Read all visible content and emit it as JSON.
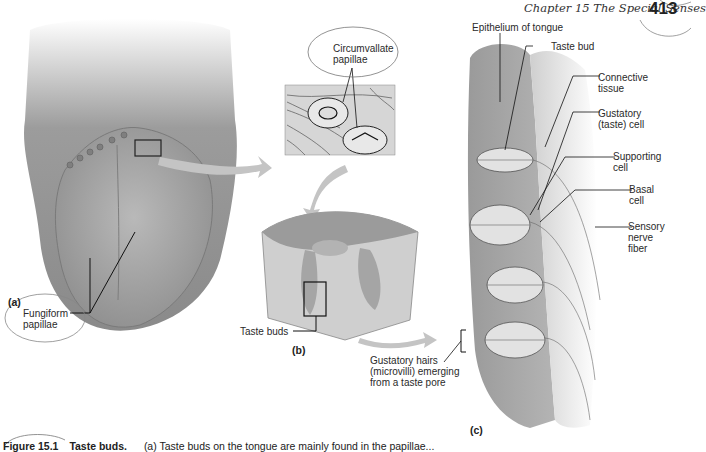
{
  "header": {
    "chapter": "Chapter 15   The Special Senses",
    "page_number": "413"
  },
  "panels": {
    "a": {
      "letter": "(a)",
      "labels": {
        "fungiform_line1": "Fungiform",
        "fungiform_line2": "papillae"
      }
    },
    "b": {
      "letter": "(b)",
      "labels": {
        "circumvallate_line1": "Circumvallate",
        "circumvallate_line2": "papillae",
        "taste_buds": "Taste buds"
      }
    },
    "c": {
      "letter": "(c)",
      "labels": {
        "epithelium": "Epithelium of tongue",
        "taste_bud": "Taste bud",
        "connective_line1": "Connective",
        "connective_line2": "tissue",
        "gustatory_line1": "Gustatory",
        "gustatory_line2": "(taste) cell",
        "supporting_line1": "Supporting",
        "supporting_line2": "cell",
        "basal_line1": "Basal",
        "basal_line2": "cell",
        "sensory_line1": "Sensory",
        "sensory_line2": "nerve",
        "sensory_line3": "fiber",
        "hairs_line1": "Gustatory hairs",
        "hairs_line2": "(microvilli) emerging",
        "hairs_line3": "from a taste pore"
      }
    }
  },
  "caption": {
    "figure": "Figure 15.1",
    "title": "Taste buds.",
    "body": "(a) Taste buds on the tongue are mainly found in the papillae..."
  }
}
